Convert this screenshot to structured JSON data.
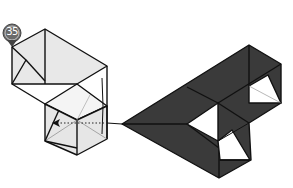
{
  "diagram": {
    "step_number": "35",
    "colors": {
      "paper_light": "#e6e6e6",
      "paper_dark": "#3a3a3a",
      "outline": "#111111",
      "badge": "#6a6a6a",
      "inner_white": "#ffffff"
    },
    "annotations": {
      "arrow": "dotted-arrow-left",
      "instruction": "fold-model-behind / flip over"
    }
  }
}
